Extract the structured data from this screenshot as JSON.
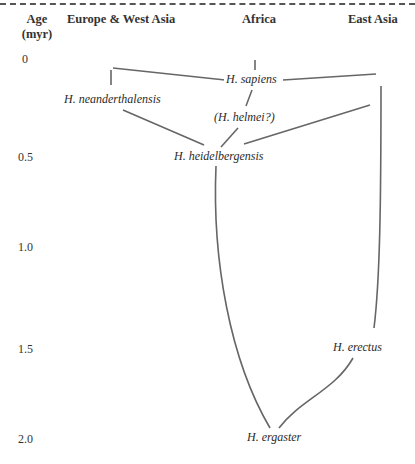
{
  "header": {
    "age_label_line1": "Age",
    "age_label_line2": "(myr)",
    "columns": [
      {
        "label": "Europe & West Asia"
      },
      {
        "label": "Africa"
      },
      {
        "label": "East Asia"
      }
    ]
  },
  "y_axis": {
    "ticks": [
      "0",
      "0.5",
      "1.0",
      "1.5",
      "2.0"
    ]
  },
  "taxa": {
    "sapiens": "H. sapiens",
    "neanderthalensis": "H. neanderthalensis",
    "helmei": "(H. helmei?)",
    "heidelbergensis": "H. heidelbergensis",
    "erectus": "H. erectus",
    "ergaster": "H. ergaster"
  },
  "colors": {
    "line": "#666666",
    "text": "#2a2a2a"
  }
}
